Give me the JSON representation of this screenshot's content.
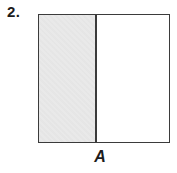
{
  "problem": {
    "number": "2."
  },
  "figure": {
    "type": "rectangle-partition",
    "label": "A",
    "regions": [
      {
        "name": "left",
        "fill": "shaded"
      },
      {
        "name": "right",
        "fill": "white"
      }
    ]
  },
  "colors": {
    "background": "#ffffff",
    "shaded_fill": "#e9e9e9",
    "outline": "#3b3b3b",
    "text": "#1c1c1c"
  }
}
